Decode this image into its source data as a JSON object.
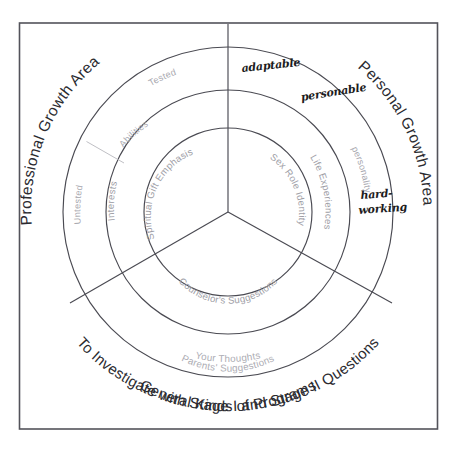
{
  "diagram": {
    "frame": {
      "border_color": "#53535a"
    },
    "sectors": [
      {
        "id": "professional",
        "label": "Professional Growth Area"
      },
      {
        "id": "personal",
        "label": "Personal Growth Area"
      },
      {
        "id": "programs",
        "label_line1": "General Kinds of Programs",
        "label_line2": "To Investigate with Stage I and Stage II Questions"
      }
    ],
    "outer_labels": {
      "professional": "Professional Growth Area",
      "personal": "Personal Growth Area",
      "programs_line1": "General Kinds of Programs",
      "programs_line2": "To Investigate with Stage I and Stage II Questions"
    },
    "ring_labels": {
      "outer_ring": [
        {
          "id": "tested",
          "text": "Tested"
        },
        {
          "id": "untested",
          "text": "Untested"
        },
        {
          "id": "personality",
          "text": "personality"
        },
        {
          "id": "your-thoughts",
          "text": "Your Thoughts"
        }
      ],
      "middle_ring": [
        {
          "id": "abilities",
          "text": "Abilities"
        },
        {
          "id": "interests",
          "text": "Interests"
        },
        {
          "id": "life-experiences",
          "text": "Life Experiences"
        },
        {
          "id": "parents-suggestions",
          "text": "Parents' Suggestions"
        }
      ],
      "inner_ring": [
        {
          "id": "spiritual-gift-emphasis",
          "text": "Spiritual Gift Emphasis"
        },
        {
          "id": "sex-role-identity",
          "text": "Sex Role Identity"
        },
        {
          "id": "counselors-suggestions",
          "text": "Counselor's Suggestions"
        }
      ]
    },
    "handwritten_notes": [
      {
        "id": "adaptable",
        "text": "adaptable"
      },
      {
        "id": "personable",
        "text": "personable"
      },
      {
        "id": "hard-working-line1",
        "text": "hard-"
      },
      {
        "id": "hard-working-line2",
        "text": "working"
      }
    ],
    "colors": {
      "frame_stroke": "#53535a",
      "ring_stroke": "#4a4a52",
      "major_label": "#2b2b30",
      "faint_label": "#a9a9b0",
      "note_ink": "#1c1c21",
      "background": "#ffffff"
    },
    "geometry": {
      "center_x": 228,
      "center_y": 212,
      "radius_outer": 165,
      "radius_middle": 122,
      "radius_inner": 84,
      "spoke_angles_deg": [
        90,
        210,
        330
      ]
    }
  }
}
